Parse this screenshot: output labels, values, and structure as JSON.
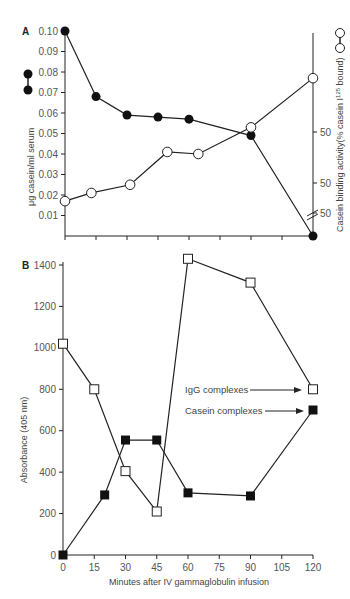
{
  "chart_data": [
    {
      "panel": "A",
      "type": "line",
      "xlabel": "",
      "ylabel_left": "μg casein/ml serum",
      "ylabel_right": "Casein binding activity(% casein I125 bound)",
      "ylim": [
        0,
        0.1
      ],
      "yticks": [
        "0.10",
        "0.09",
        "0.08",
        "0.07",
        "0.06",
        "0.05",
        "0.04",
        "0.03",
        "0.02",
        "0.01"
      ],
      "right_yticks": [
        "50",
        "50",
        "50"
      ],
      "x_ticks_count": 9,
      "series": [
        {
          "name": "μg casein/ml serum",
          "marker": "filled-circle",
          "x_px": [
            0,
            1,
            2,
            3,
            4,
            6,
            8
          ],
          "values": [
            0.1,
            0.068,
            0.059,
            0.058,
            0.057,
            0.049,
            0.0
          ]
        },
        {
          "name": "Casein binding activity",
          "marker": "open-circle",
          "x_px": [
            0,
            0.85,
            2.1,
            3.3,
            4.3,
            6.0,
            8
          ],
          "values": [
            0.017,
            0.021,
            0.025,
            0.041,
            0.04,
            0.053,
            0.077
          ]
        }
      ]
    },
    {
      "panel": "B",
      "type": "line",
      "xlabel": "Minutes after IV gammaglobulin infusion",
      "ylabel": "Absorbance (405 nm)",
      "ylim": [
        0,
        1400
      ],
      "xlim": [
        0,
        120
      ],
      "yticks": [
        "0",
        "200",
        "400",
        "600",
        "800",
        "1000",
        "1200",
        "1400"
      ],
      "xticks": [
        "0",
        "15",
        "30",
        "45",
        "60",
        "75",
        "90",
        "105",
        "120"
      ],
      "series": [
        {
          "name": "IgG complexes",
          "marker": "open-square",
          "x": [
            0,
            15,
            30,
            45,
            60,
            90,
            120
          ],
          "values": [
            1020,
            800,
            405,
            210,
            1430,
            1315,
            800
          ]
        },
        {
          "name": "Casein complexes",
          "marker": "filled-square",
          "x": [
            0,
            20,
            30,
            45,
            60,
            90,
            120
          ],
          "values": [
            0,
            290,
            555,
            555,
            300,
            285,
            700
          ]
        }
      ],
      "annotations": [
        "IgG complexes",
        "Casein complexes"
      ]
    }
  ],
  "labels": {
    "panel_a": "A",
    "panel_b": "B",
    "a_ylabel_left": "μg casein/ml serum",
    "a_ylabel_right": "Casein binding activity(% casein I",
    "a_ylabel_right_sup": "125",
    "a_ylabel_right_end": " bound)",
    "b_ylabel": "Absorbance (405 nm)",
    "b_xlabel": "Minutes after IV gammaglobulin infusion",
    "legend_igg": "IgG complexes",
    "legend_casein": "Casein complexes"
  }
}
